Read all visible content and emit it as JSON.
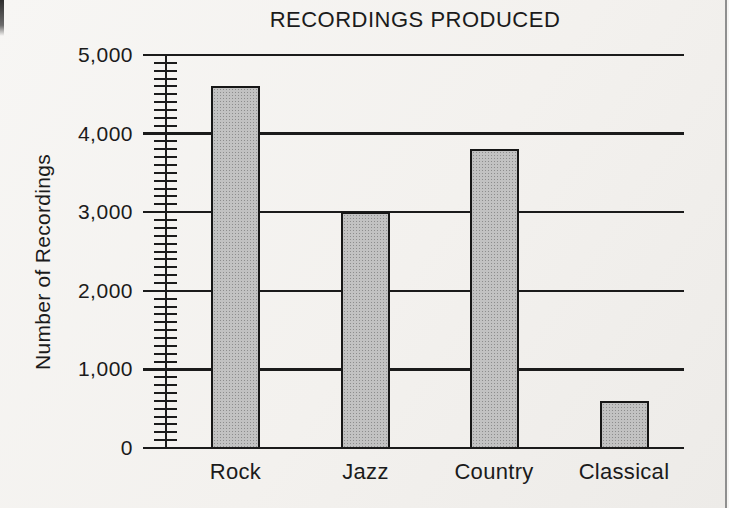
{
  "chart_data": {
    "type": "bar",
    "title": "RECORDINGS PRODUCED",
    "ylabel": "Number of Recordings",
    "xlabel": "",
    "categories": [
      "Rock",
      "Jazz",
      "Country",
      "Classical"
    ],
    "values": [
      4600,
      3000,
      3800,
      600
    ],
    "ylim": [
      0,
      5000
    ],
    "ytick_interval": 1000,
    "minor_tick_interval": 100,
    "ytick_labels": [
      "0",
      "1,000",
      "2,000",
      "3,000",
      "4,000",
      "5,000"
    ],
    "grid": true,
    "legend": "none"
  },
  "colors": {
    "background": "#f3f1ee",
    "ink": "#1b1b1b",
    "bar_fill": "#c2c2c2",
    "bar_border": "#161616",
    "page_edge": "#8f8f8f"
  }
}
